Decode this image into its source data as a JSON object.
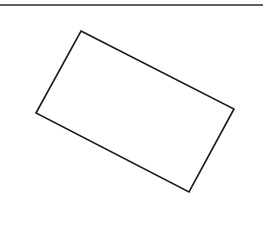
{
  "canvas": {
    "width": 263,
    "height": 227,
    "background": "#ffffff"
  },
  "top_rule": {
    "x1": 0,
    "y1": 5,
    "x2": 263,
    "y2": 5,
    "stroke": "#2a2a2a",
    "stroke_width": 1.6
  },
  "shape": {
    "type": "rectangle-rotated",
    "points": [
      [
        81,
        31
      ],
      [
        234,
        109
      ],
      [
        189,
        192
      ],
      [
        36,
        113
      ]
    ],
    "stroke": "#1a1a1a",
    "stroke_width": 1.6,
    "fill": "none"
  }
}
